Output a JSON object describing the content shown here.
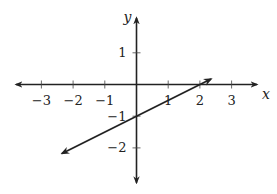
{
  "chart_data": {
    "type": "line",
    "title": "",
    "xlabel": "x",
    "ylabel": "y",
    "xlim": [
      -3.8,
      3.8
    ],
    "ylim": [
      -3.1,
      2.1
    ],
    "grid": false,
    "x_ticks": [
      -3,
      -2,
      -1,
      1,
      2,
      3
    ],
    "x_tick_labels": [
      "−3",
      "−2",
      "−1",
      "1",
      "2",
      "3"
    ],
    "y_ticks": [
      1,
      -1,
      -2
    ],
    "y_tick_labels": [
      "1",
      "−1",
      "−2"
    ],
    "series": [
      {
        "name": "line",
        "equation": "y = 0.5x - 1",
        "slope": 0.5,
        "intercept": -1,
        "x": [
          -2.35,
          2.35
        ],
        "y": [
          -2.175,
          0.175
        ],
        "arrows": "both",
        "color": "#222222"
      }
    ]
  }
}
